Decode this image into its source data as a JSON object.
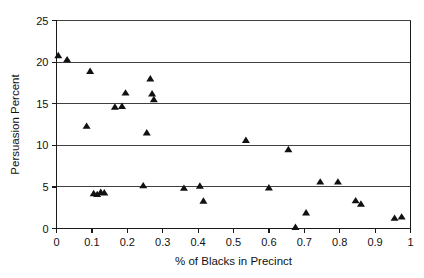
{
  "chart_data": {
    "type": "scatter",
    "title": "",
    "xlabel": "% of Blacks in Precinct",
    "ylabel": "Persuasion Percent",
    "xlim": [
      0,
      1
    ],
    "ylim": [
      0,
      25
    ],
    "xticks": [
      0,
      0.1,
      0.2,
      0.3,
      0.4,
      0.5,
      0.6,
      0.7,
      0.8,
      0.9,
      1
    ],
    "xticklabels": [
      "0",
      "0.1",
      "0.2",
      "0.3",
      "0.4",
      "0.5",
      "0.6",
      "0.7",
      "0.8",
      "0.9",
      "1"
    ],
    "yticks": [
      0,
      5,
      10,
      15,
      20,
      25
    ],
    "yticklabels": [
      "0",
      "5",
      "10",
      "15",
      "20",
      "25"
    ],
    "grid": "horizontal",
    "gridlines_y": [
      5,
      10,
      15,
      20,
      25
    ],
    "legend": null,
    "marker": "triangle",
    "marker_color": "#111111",
    "points": [
      {
        "x": 0.005,
        "y": 20.8
      },
      {
        "x": 0.03,
        "y": 20.3
      },
      {
        "x": 0.095,
        "y": 18.9
      },
      {
        "x": 0.085,
        "y": 12.3
      },
      {
        "x": 0.105,
        "y": 4.2
      },
      {
        "x": 0.115,
        "y": 4.1
      },
      {
        "x": 0.125,
        "y": 4.35
      },
      {
        "x": 0.135,
        "y": 4.3
      },
      {
        "x": 0.165,
        "y": 14.6
      },
      {
        "x": 0.185,
        "y": 14.7
      },
      {
        "x": 0.195,
        "y": 16.3
      },
      {
        "x": 0.245,
        "y": 5.15
      },
      {
        "x": 0.265,
        "y": 18.0
      },
      {
        "x": 0.27,
        "y": 16.2
      },
      {
        "x": 0.275,
        "y": 15.5
      },
      {
        "x": 0.255,
        "y": 11.5
      },
      {
        "x": 0.36,
        "y": 4.85
      },
      {
        "x": 0.405,
        "y": 5.1
      },
      {
        "x": 0.415,
        "y": 3.3
      },
      {
        "x": 0.535,
        "y": 10.6
      },
      {
        "x": 0.6,
        "y": 4.9
      },
      {
        "x": 0.655,
        "y": 9.5
      },
      {
        "x": 0.675,
        "y": 0.15
      },
      {
        "x": 0.705,
        "y": 1.9
      },
      {
        "x": 0.745,
        "y": 5.6
      },
      {
        "x": 0.795,
        "y": 5.6
      },
      {
        "x": 0.845,
        "y": 3.35
      },
      {
        "x": 0.86,
        "y": 2.95
      },
      {
        "x": 0.955,
        "y": 1.25
      },
      {
        "x": 0.975,
        "y": 1.4
      }
    ]
  }
}
